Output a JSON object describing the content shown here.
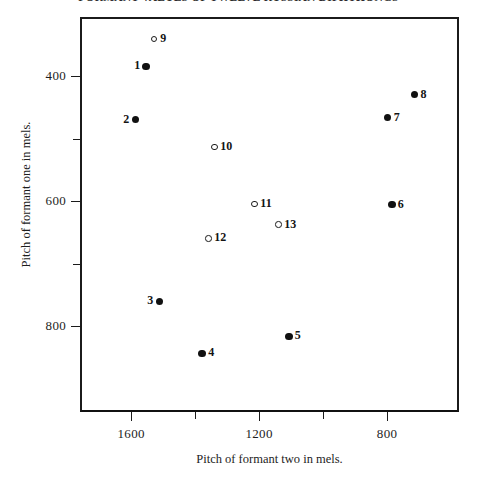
{
  "chart_data": {
    "type": "scatter",
    "title": "FORMANT VALUES OF TWELVE RUSSIAN DIPHTHONGS",
    "xlabel": "Pitch of formant two in mels.",
    "ylabel": "Pitch of formant one in mels.",
    "xlim": [
      1760,
      575
    ],
    "ylim": [
      305,
      937
    ],
    "x_axis_inverted": true,
    "y_axis_inverted": true,
    "grid": false,
    "legend": null,
    "xticks": [
      1600,
      1400,
      1200,
      1000,
      800
    ],
    "xtick_labels": [
      "1600",
      "",
      "1200",
      "",
      "800"
    ],
    "yticks": [
      400,
      500,
      600,
      700,
      800
    ],
    "ytick_labels": [
      "400",
      "",
      "600",
      "",
      "800"
    ],
    "series": [
      {
        "name": "filled",
        "marker": "filled-circle",
        "points": [
          {
            "label": "1",
            "x": 1553,
            "y": 384,
            "label_side": "left"
          },
          {
            "label": "2",
            "x": 1587,
            "y": 469,
            "label_side": "left"
          },
          {
            "label": "3",
            "x": 1512,
            "y": 760,
            "label_side": "left"
          },
          {
            "label": "4",
            "x": 1378,
            "y": 843,
            "label_side": "right"
          },
          {
            "label": "5",
            "x": 1107,
            "y": 816,
            "label_side": "right"
          },
          {
            "label": "6",
            "x": 785,
            "y": 605,
            "label_side": "right"
          },
          {
            "label": "7",
            "x": 798,
            "y": 466,
            "label_side": "right"
          },
          {
            "label": "8",
            "x": 714,
            "y": 429,
            "label_side": "right"
          }
        ]
      },
      {
        "name": "open",
        "marker": "open-circle",
        "points": [
          {
            "label": "9",
            "x": 1528,
            "y": 340,
            "label_side": "right"
          },
          {
            "label": "10",
            "x": 1340,
            "y": 513,
            "label_side": "right"
          },
          {
            "label": "11",
            "x": 1215,
            "y": 604,
            "label_side": "right"
          },
          {
            "label": "12",
            "x": 1359,
            "y": 659,
            "label_side": "right"
          },
          {
            "label": "13",
            "x": 1140,
            "y": 637,
            "label_side": "right"
          }
        ]
      }
    ]
  },
  "figure": {
    "background_color": "#ffffff",
    "axis_color": "#1b1b1b",
    "marker_color": "#111111"
  }
}
